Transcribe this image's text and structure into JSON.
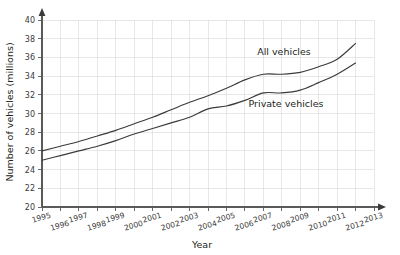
{
  "chart_data": {
    "type": "line",
    "title": "",
    "xlabel": "Year",
    "ylabel": "Number of vehicles (millions)",
    "xlim": [
      1995,
      2013
    ],
    "ylim": [
      20,
      40
    ],
    "ytick_step": 2,
    "grid": true,
    "legend_position": "inline-annotation",
    "x": [
      1995,
      1996,
      1997,
      1998,
      1999,
      2000,
      2001,
      2002,
      2003,
      2004,
      2005,
      2006,
      2007,
      2008,
      2009,
      2010,
      2011,
      2012
    ],
    "xticks": [
      "1995",
      "1996",
      "1997",
      "1998",
      "1999",
      "2000",
      "2001",
      "2002",
      "2003",
      "2004",
      "2005",
      "2006",
      "2007",
      "2008",
      "2009",
      "2010",
      "2011",
      "2012",
      "2013"
    ],
    "yticks": [
      "20",
      "22",
      "24",
      "26",
      "28",
      "30",
      "32",
      "34",
      "36",
      "38",
      "40"
    ],
    "series": [
      {
        "name": "All vehicles",
        "label": "All vehicles",
        "color": "#3b3b3b",
        "values": [
          26.0,
          26.5,
          27.0,
          27.6,
          28.2,
          28.9,
          29.6,
          30.4,
          31.2,
          31.9,
          32.7,
          33.6,
          34.2,
          34.2,
          34.4,
          35.0,
          35.8,
          37.5
        ]
      },
      {
        "name": "Private vehicles",
        "label": "Private vehicles",
        "color": "#3b3b3b",
        "values": [
          25.0,
          25.5,
          26.0,
          26.5,
          27.1,
          27.8,
          28.4,
          29.0,
          29.6,
          30.5,
          30.8,
          31.4,
          32.2,
          32.2,
          32.5,
          33.3,
          34.2,
          35.4
        ]
      }
    ],
    "annotations": [
      {
        "text": "All vehicles",
        "x_px": 284,
        "y_px": 55
      },
      {
        "text": "Private vehicles",
        "x_px": 286,
        "y_px": 107
      }
    ]
  },
  "axes": {
    "y_axis_title": "Number of vehicles (millions)",
    "x_axis_title": "Year"
  }
}
